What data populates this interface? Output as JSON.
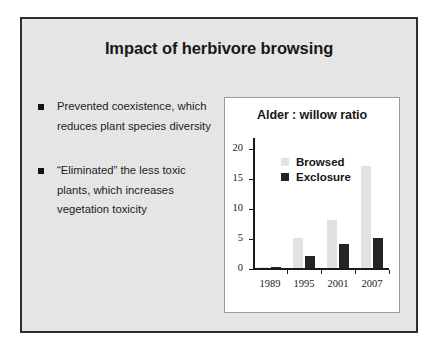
{
  "slide": {
    "title": "Impact of herbivore browsing",
    "background_color": "#e9e9e9",
    "border_color": "#2e2e2e",
    "bullets": [
      {
        "marker": "square-bullet-icon",
        "text": "Prevented coexistence, which reduces plant species diversity"
      },
      {
        "marker": "square-bullet-icon",
        "text": "“Eliminated” the less toxic plants, which increases vegetation toxicity"
      }
    ]
  },
  "chart_data": {
    "type": "bar",
    "title": "Alder : willow ratio",
    "xlabel": "",
    "ylabel": "",
    "categories": [
      "1989",
      "1995",
      "2001",
      "2007"
    ],
    "series": [
      {
        "name": "Browsed",
        "color": "#e2e2e2",
        "values": [
          0.2,
          5,
          8,
          17
        ]
      },
      {
        "name": "Exclosure",
        "color": "#242424",
        "values": [
          0.3,
          2,
          4,
          5
        ]
      }
    ],
    "ylim": [
      0,
      22
    ],
    "yticks": [
      0,
      5,
      10,
      15,
      20
    ],
    "ytick_labels": [
      "0",
      "5",
      "10",
      "15",
      "20"
    ],
    "grid": false,
    "legend_position": "upper-left-inside",
    "panel_background": "#ffffff",
    "panel_border_color": "#9a9a9a"
  }
}
